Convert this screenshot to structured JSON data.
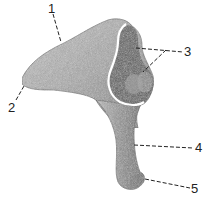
{
  "figure": {
    "labels": [
      {
        "id": "1",
        "text": "1"
      },
      {
        "id": "2",
        "text": "2"
      },
      {
        "id": "3",
        "text": "3"
      },
      {
        "id": "4",
        "text": "4"
      },
      {
        "id": "5",
        "text": "5"
      }
    ],
    "colors": {
      "ink": "#222222",
      "shade": "#6e6e6e",
      "light": "#cfcfcf",
      "background": "#ffffff"
    }
  }
}
